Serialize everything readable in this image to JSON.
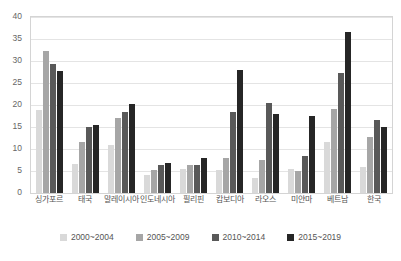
{
  "chart_data": {
    "type": "bar",
    "title": "",
    "subtitle": "",
    "xlabel": "",
    "ylabel": "",
    "ylim": [
      0,
      40
    ],
    "yticks": [
      0,
      5,
      10,
      15,
      20,
      25,
      30,
      35,
      40
    ],
    "ytick_labels": [
      "0",
      "5",
      "10",
      "15",
      "20",
      "25",
      "30",
      "35",
      "40"
    ],
    "grid": true,
    "legend_position": "bottom",
    "categories": [
      "싱가포르",
      "태국",
      "말레이시아",
      "인도네시아",
      "필리핀",
      "캄보디아",
      "라오스",
      "미얀마",
      "베트남",
      "한국"
    ],
    "series": [
      {
        "name": "2000~2004",
        "color": "#d9d9d9",
        "values": [
          18.8,
          6.5,
          11.0,
          4.0,
          5.5,
          5.3,
          3.5,
          5.5,
          11.5,
          6.0
        ]
      },
      {
        "name": "2005~2009",
        "color": "#a6a6a6",
        "values": [
          32.2,
          11.5,
          17.0,
          5.3,
          6.3,
          8.0,
          7.5,
          5.0,
          19.0,
          12.8
        ]
      },
      {
        "name": "2010~2014",
        "color": "#595959",
        "values": [
          29.4,
          15.0,
          18.5,
          6.3,
          6.3,
          18.5,
          20.5,
          8.3,
          27.3,
          16.7
        ]
      },
      {
        "name": "2015~2019",
        "color": "#262626",
        "values": [
          27.8,
          15.5,
          20.3,
          6.8,
          8.0,
          28.0,
          18.0,
          17.5,
          36.7,
          15.0
        ]
      }
    ]
  }
}
